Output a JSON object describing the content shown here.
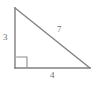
{
  "diagram": {
    "type": "right-triangle",
    "canvas": {
      "width": 97,
      "height": 86,
      "background_color": "#ffffff"
    },
    "style": {
      "stroke_color": "#808080",
      "stroke_width": 1.4,
      "label_color": "#6e6e6e",
      "right_angle_marker_color": "#8c8c8c"
    },
    "vertices": {
      "top": {
        "x": 15,
        "y": 8
      },
      "bottom_left": {
        "x": 15,
        "y": 68
      },
      "bottom_right": {
        "x": 90,
        "y": 68
      }
    },
    "right_angle_marker": {
      "at_vertex": "bottom_left",
      "size": 11,
      "x": 16,
      "y": 57
    },
    "sides": [
      {
        "name": "leg-vertical",
        "label": "3",
        "from": "top",
        "to": "bottom_left",
        "position": "left"
      },
      {
        "name": "hypotenuse",
        "label": "7",
        "from": "top",
        "to": "bottom_right",
        "position": "upper-right"
      },
      {
        "name": "leg-horizontal",
        "label": "4",
        "from": "bottom_left",
        "to": "bottom_right",
        "position": "bottom"
      }
    ]
  }
}
